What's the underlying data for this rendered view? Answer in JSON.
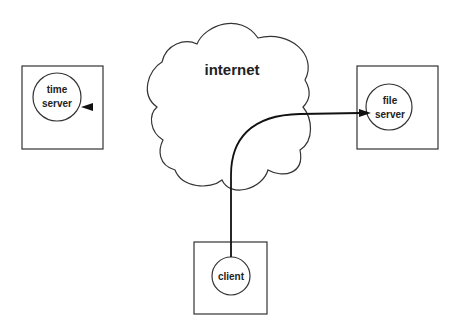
{
  "diagram": {
    "cloud": {
      "label": "internet"
    },
    "nodes": [
      {
        "id": "time-server",
        "lines": [
          "time",
          "server"
        ]
      },
      {
        "id": "file-server",
        "lines": [
          "file",
          "server"
        ]
      },
      {
        "id": "client",
        "lines": [
          "client"
        ]
      }
    ],
    "edges": [
      {
        "from": "file-server",
        "to": "time-server",
        "via": "internet",
        "color_left": "#2e7d32",
        "color_right": "#222222"
      },
      {
        "from": "client",
        "to": "file-server",
        "via": "internet",
        "color": "#222222"
      }
    ]
  }
}
